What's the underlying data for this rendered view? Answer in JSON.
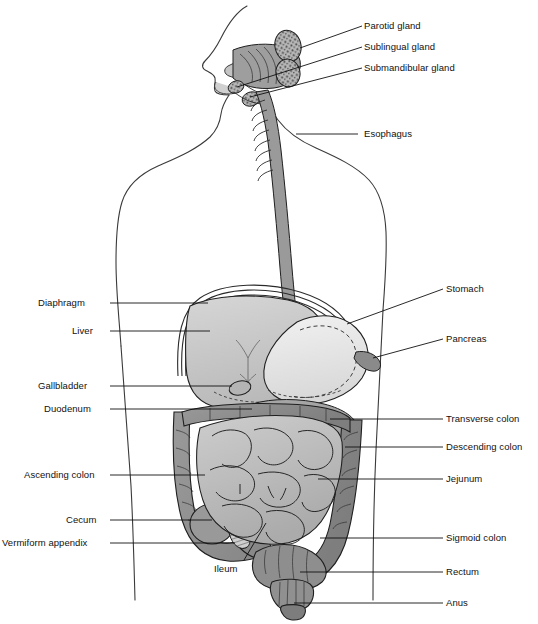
{
  "diagram": {
    "view": "anterior torso with sagittal head section",
    "style": "grayscale line drawing with leader lines",
    "background_color": "#ffffff",
    "line_color": "#1a1a1a",
    "label_color": "#111111"
  },
  "labels_right": [
    {
      "id": "parotid-gland",
      "text": "Parotid gland",
      "x": 364,
      "y": 20,
      "leader_from": [
        362,
        26
      ],
      "leader_to": [
        300,
        48
      ]
    },
    {
      "id": "sublingual-gland",
      "text": "Sublingual gland",
      "x": 364,
      "y": 41,
      "leader_from": [
        362,
        47
      ],
      "leader_to": [
        237,
        87
      ]
    },
    {
      "id": "submandibular-gland",
      "text": "Submandibular gland",
      "x": 364,
      "y": 62,
      "leader_from": [
        362,
        68
      ],
      "leader_to": [
        250,
        97
      ]
    },
    {
      "id": "esophagus",
      "text": "Esophagus",
      "x": 364,
      "y": 128,
      "leader_from": [
        358,
        134
      ],
      "leader_to": [
        296,
        134
      ]
    },
    {
      "id": "stomach",
      "text": "Stomach",
      "x": 446,
      "y": 283,
      "leader_from": [
        443,
        289
      ],
      "leader_to": [
        347,
        324
      ]
    },
    {
      "id": "pancreas",
      "text": "Pancreas",
      "x": 446,
      "y": 333,
      "leader_from": [
        443,
        339
      ],
      "leader_to": [
        373,
        358
      ]
    },
    {
      "id": "transverse-colon",
      "text": "Transverse colon",
      "x": 446,
      "y": 413,
      "leader_from": [
        443,
        419
      ],
      "leader_to": [
        330,
        419
      ]
    },
    {
      "id": "descending-colon",
      "text": "Descending colon",
      "x": 446,
      "y": 441,
      "leader_from": [
        443,
        447
      ],
      "leader_to": [
        345,
        447
      ]
    },
    {
      "id": "jejunum",
      "text": "Jejunum",
      "x": 446,
      "y": 473,
      "leader_from": [
        443,
        479
      ],
      "leader_to": [
        318,
        479
      ]
    },
    {
      "id": "sigmoid-colon",
      "text": "Sigmoid colon",
      "x": 446,
      "y": 532,
      "leader_from": [
        443,
        538
      ],
      "leader_to": [
        320,
        538
      ]
    },
    {
      "id": "rectum",
      "text": "Rectum",
      "x": 446,
      "y": 566,
      "leader_from": [
        443,
        572
      ],
      "leader_to": [
        300,
        572
      ]
    },
    {
      "id": "anus",
      "text": "Anus",
      "x": 446,
      "y": 597,
      "leader_from": [
        443,
        603
      ],
      "leader_to": [
        294,
        603
      ]
    }
  ],
  "labels_left": [
    {
      "id": "diaphragm",
      "text": "Diaphragm",
      "x": 38,
      "y": 297,
      "leader_from": [
        110,
        303
      ],
      "leader_to": [
        208,
        303
      ]
    },
    {
      "id": "liver",
      "text": "Liver",
      "x": 72,
      "y": 325,
      "leader_from": [
        110,
        331
      ],
      "leader_to": [
        210,
        331
      ]
    },
    {
      "id": "gallbladder",
      "text": "Gallbladder",
      "x": 38,
      "y": 380,
      "leader_from": [
        110,
        386
      ],
      "leader_to": [
        232,
        386
      ]
    },
    {
      "id": "duodenum",
      "text": "Duodenum",
      "x": 44,
      "y": 403,
      "leader_from": [
        110,
        409
      ],
      "leader_to": [
        252,
        409
      ]
    },
    {
      "id": "ascending-colon",
      "text": "Ascending colon",
      "x": 24,
      "y": 469,
      "leader_from": [
        110,
        475
      ],
      "leader_to": [
        205,
        475
      ]
    },
    {
      "id": "cecum",
      "text": "Cecum",
      "x": 66,
      "y": 514,
      "leader_from": [
        110,
        520
      ],
      "leader_to": [
        212,
        520
      ]
    },
    {
      "id": "vermiform-appendix",
      "text": "Vermiform appendix",
      "x": 2,
      "y": 537,
      "leader_from": [
        110,
        543
      ],
      "leader_to": [
        235,
        543
      ]
    }
  ],
  "labels_inner": [
    {
      "id": "ileum",
      "text": "Ileum",
      "x": 214,
      "y": 563,
      "leader_from": [
        244,
        560
      ],
      "leader_to": [
        266,
        523
      ]
    }
  ],
  "organ_colors": {
    "liver": "#c9c9c9",
    "stomach": "#e8e8e8",
    "colon": "#8e8e8e",
    "small_intestine": "#bdbdbd",
    "esophagus": "#9a9a9a",
    "gland": "#a8a8a8",
    "body_outline": "#3a3a3a"
  }
}
